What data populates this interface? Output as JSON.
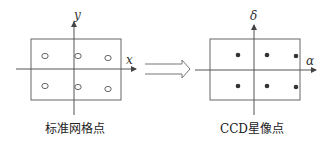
{
  "left_panel": {
    "caption": "标准网格点",
    "x_axis_label": "x",
    "y_axis_label": "y",
    "points": [
      {
        "x": 45,
        "y": 56
      },
      {
        "x": 78,
        "y": 56
      },
      {
        "x": 108,
        "y": 58
      },
      {
        "x": 45,
        "y": 86
      },
      {
        "x": 78,
        "y": 87
      },
      {
        "x": 108,
        "y": 89
      }
    ],
    "marker": "hollow-circle"
  },
  "right_panel": {
    "caption": "CCD星像点",
    "x_axis_label": "α",
    "y_axis_label": "δ",
    "points": [
      {
        "x": 238,
        "y": 55
      },
      {
        "x": 267,
        "y": 55
      },
      {
        "x": 296,
        "y": 56
      },
      {
        "x": 238,
        "y": 86
      },
      {
        "x": 267,
        "y": 86
      },
      {
        "x": 296,
        "y": 87
      }
    ],
    "marker": "filled-dot"
  },
  "transform_arrow": {
    "direction": "right",
    "style": "double-line-hollow"
  },
  "colors": {
    "stroke": "#555555",
    "dot": "#333333"
  }
}
